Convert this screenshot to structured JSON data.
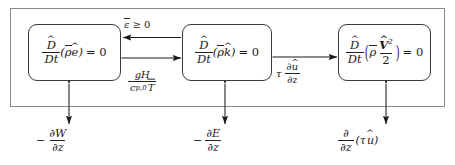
{
  "diagram": {
    "frame_label": "outer-system-boundary",
    "boxes": [
      {
        "id": "internal-energy",
        "name": "internal energy equation",
        "equation": "D̂/Dt (ρ̄ ê) = 0",
        "numerator": "D",
        "denominator": "Dt",
        "argument": "ρe",
        "rhs": "= 0",
        "rho": "ρ",
        "var": "e",
        "open_paren": "(",
        "close_paren": ")"
      },
      {
        "id": "turbulent-kinetic-energy",
        "name": "turbulent kinetic energy equation",
        "equation": "D̂/Dt (ρ̄ k̂) = 0",
        "numerator": "D",
        "denominator": "Dt",
        "argument": "ρk",
        "rhs": "= 0",
        "rho": "ρ",
        "var": "k",
        "open_paren": "(",
        "close_paren": ")"
      },
      {
        "id": "mean-kinetic-energy",
        "name": "mean kinetic energy equation",
        "equation": "D̂/Dt (ρ̄ V̂²/2) = 0",
        "numerator": "D",
        "denominator": "Dt",
        "rhs": "= 0",
        "rho": "ρ",
        "var": "V",
        "exponent": "2",
        "half_denominator": "2",
        "open_paren": "(",
        "close_paren": ")"
      }
    ],
    "arrow_labels": [
      {
        "id": "dissipation",
        "text": "ε̄ ≥ 0",
        "epsilon": "ε",
        "relation": "≥ 0",
        "direction": "tke-to-internal-energy"
      },
      {
        "id": "buoyancy-flux",
        "text": "gH / (c_p,0 T̄̄)",
        "num_g": "g",
        "num_H": "H",
        "den_c": "c",
        "den_sub": "p,0",
        "den_T": "T",
        "direction": "internal-energy-to-tke"
      },
      {
        "id": "shear-production",
        "text": "τ ∂û/∂z",
        "tau": "τ",
        "num": "∂û",
        "den": "∂z",
        "partial": "∂",
        "var": "u",
        "z": "z",
        "direction": "mean-ke-to-tke"
      }
    ],
    "bottom_labels": [
      {
        "id": "vertical-flux-W",
        "text": "− ∂W/∂z",
        "minus": "−",
        "num_partial": "∂",
        "num_var": "W",
        "den_partial": "∂",
        "den_var": "z"
      },
      {
        "id": "vertical-flux-E",
        "text": "− ∂E/∂z",
        "minus": "−",
        "num_partial": "∂",
        "num_var": "E",
        "den_partial": "∂",
        "den_var": "z"
      },
      {
        "id": "stress-divergence",
        "text": "∂/∂z (τ û)",
        "num_partial": "∂",
        "den_partial": "∂",
        "den_var": "z",
        "open_paren": "(",
        "tau": "τ",
        "var": "u",
        "close_paren": ")"
      }
    ],
    "colors": {
      "frame_stroke": "#8a8a8a",
      "box_stroke": "#3a3a3a",
      "arrow_stroke": "#1a1a1a",
      "text": "#1a1a1a",
      "background": "#ffffff"
    }
  }
}
